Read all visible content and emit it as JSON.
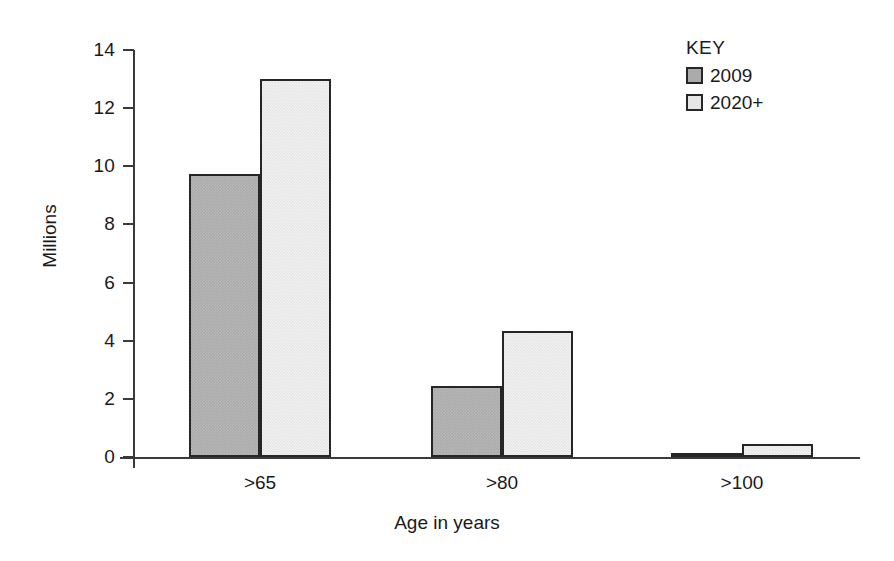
{
  "chart_data": {
    "type": "bar",
    "title": "",
    "xlabel": "Age in years",
    "ylabel": "Millions",
    "categories": [
      ">65",
      ">80",
      ">100"
    ],
    "series": [
      {
        "name": "2009",
        "values": [
          9.75,
          2.45,
          0.15
        ],
        "color": "#ababab"
      },
      {
        "name": "2020+",
        "values": [
          13.0,
          4.35,
          0.45
        ],
        "color": "#e6e6e6"
      }
    ],
    "ylim": [
      0,
      14
    ],
    "yticks": [
      0,
      2,
      4,
      6,
      8,
      10,
      12,
      14
    ],
    "ytick_labels": [
      "0",
      "2",
      "4",
      "6",
      "8",
      "10",
      "12",
      "14"
    ],
    "grid": false,
    "legend_position": "top-right",
    "legend_title": "KEY"
  },
  "legend": {
    "title": "KEY",
    "entries": [
      {
        "label": "2009"
      },
      {
        "label": "2020+"
      }
    ]
  },
  "axes": {
    "y_title": "Millions",
    "x_title": "Age in years"
  },
  "colors": {
    "series_2009": "#ababab",
    "series_2020": "#e6e6e6",
    "axis": "#3a3a3a",
    "bar_outline": "#262626",
    "text": "#1a1a1a",
    "background": "#ffffff"
  }
}
